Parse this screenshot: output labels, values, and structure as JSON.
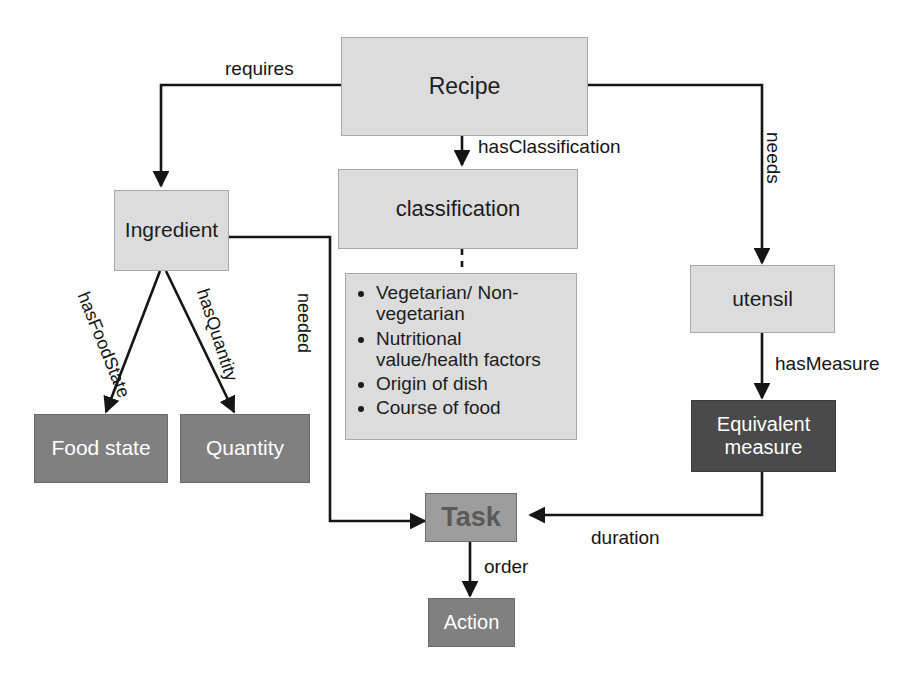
{
  "diagram": {
    "colors": {
      "light_fill": "#dcdcdc",
      "mid_fill": "#9d9d9d",
      "dark_fill": "#808080",
      "darker_fill": "#4a4a4a",
      "stroke": "#151515",
      "light_text": "#1c1c1c",
      "inverse_text": "#ffffff"
    },
    "nodes": {
      "recipe": "Recipe",
      "ingredient": "Ingredient",
      "classification": "classification",
      "utensil": "utensil",
      "food_state": "Food state",
      "quantity": "Quantity",
      "equivalent_measure": "Equivalent measure",
      "task": "Task",
      "action": "Action"
    },
    "classification_items": [
      "Vegetarian/ Non-vegetarian",
      "Nutritional value/health factors",
      "Origin of dish",
      "Course of food"
    ],
    "edges": {
      "requires": "requires",
      "has_classification": "hasClassification",
      "needs": "needs",
      "has_food_state": "hasFoodState",
      "has_quantity": "hasQuantity",
      "needed": "needed",
      "has_measure": "hasMeasure",
      "duration": "duration",
      "order": "order"
    },
    "caption": ""
  }
}
